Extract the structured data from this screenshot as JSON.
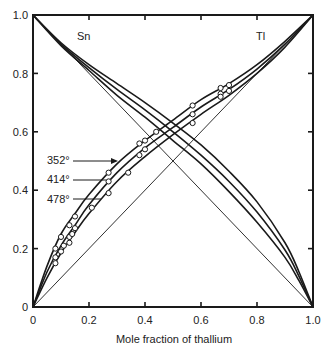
{
  "chart_data": {
    "type": "line",
    "title": "",
    "xlabel": "Mole fraction of thallium",
    "ylabel": "",
    "xlim": [
      0,
      1.0
    ],
    "ylim": [
      0,
      1.0
    ],
    "grid": false,
    "x_ticks": [
      "0",
      "0.2",
      "0.4",
      "0.6",
      "0.8",
      "1.0"
    ],
    "y_ticks": [
      "0",
      "0.2",
      "0.4",
      "0.6",
      "0.8",
      "1.0"
    ],
    "annotations": [
      {
        "text": "Sn",
        "x": 0.07,
        "y": 0.94
      },
      {
        "text": "Tl",
        "x": 0.9,
        "y": 0.94
      },
      {
        "text": "352°",
        "x": 0.04,
        "y": 0.49,
        "arrow_to": [
          0.28,
          0.48
        ]
      },
      {
        "text": "414°",
        "x": 0.04,
        "y": 0.43,
        "arrow_to": [
          0.26,
          0.43
        ]
      },
      {
        "text": "478°",
        "x": 0.04,
        "y": 0.37,
        "arrow_to": [
          0.24,
          0.37
        ]
      }
    ],
    "reference_lines": [
      {
        "name": "ideal-Tl",
        "points": [
          [
            0,
            0
          ],
          [
            1,
            1
          ]
        ]
      },
      {
        "name": "ideal-Sn",
        "points": [
          [
            0,
            1
          ],
          [
            1,
            0
          ]
        ]
      }
    ],
    "series": [
      {
        "name": "Tl 352°",
        "component": "Tl",
        "temperature": "352°",
        "curve": [
          [
            0,
            0
          ],
          [
            0.05,
            0.14
          ],
          [
            0.1,
            0.25
          ],
          [
            0.15,
            0.32
          ],
          [
            0.2,
            0.385
          ],
          [
            0.3,
            0.49
          ],
          [
            0.4,
            0.57
          ],
          [
            0.5,
            0.64
          ],
          [
            0.6,
            0.71
          ],
          [
            0.7,
            0.765
          ],
          [
            0.8,
            0.83
          ],
          [
            0.9,
            0.91
          ],
          [
            1,
            1
          ]
        ],
        "points": [
          [
            0.08,
            0.2
          ],
          [
            0.1,
            0.24
          ],
          [
            0.13,
            0.28
          ],
          [
            0.15,
            0.31
          ],
          [
            0.27,
            0.46
          ],
          [
            0.38,
            0.56
          ],
          [
            0.4,
            0.57
          ],
          [
            0.44,
            0.6
          ],
          [
            0.57,
            0.69
          ],
          [
            0.67,
            0.75
          ],
          [
            0.7,
            0.76
          ]
        ]
      },
      {
        "name": "Tl 414°",
        "component": "Tl",
        "temperature": "414°",
        "curve": [
          [
            0,
            0
          ],
          [
            0.05,
            0.12
          ],
          [
            0.1,
            0.21
          ],
          [
            0.15,
            0.28
          ],
          [
            0.2,
            0.35
          ],
          [
            0.3,
            0.46
          ],
          [
            0.4,
            0.545
          ],
          [
            0.5,
            0.615
          ],
          [
            0.6,
            0.685
          ],
          [
            0.7,
            0.745
          ],
          [
            0.8,
            0.815
          ],
          [
            0.9,
            0.9
          ],
          [
            1,
            1
          ]
        ],
        "points": [
          [
            0.08,
            0.17
          ],
          [
            0.11,
            0.21
          ],
          [
            0.13,
            0.24
          ],
          [
            0.15,
            0.27
          ],
          [
            0.27,
            0.43
          ],
          [
            0.38,
            0.52
          ],
          [
            0.4,
            0.54
          ],
          [
            0.57,
            0.66
          ],
          [
            0.67,
            0.73
          ],
          [
            0.7,
            0.74
          ]
        ]
      },
      {
        "name": "Tl 478°",
        "component": "Tl",
        "temperature": "478°",
        "curve": [
          [
            0,
            0
          ],
          [
            0.05,
            0.1
          ],
          [
            0.1,
            0.185
          ],
          [
            0.15,
            0.255
          ],
          [
            0.2,
            0.32
          ],
          [
            0.3,
            0.43
          ],
          [
            0.4,
            0.515
          ],
          [
            0.5,
            0.59
          ],
          [
            0.6,
            0.66
          ],
          [
            0.7,
            0.725
          ],
          [
            0.8,
            0.8
          ],
          [
            0.9,
            0.89
          ],
          [
            1,
            1
          ]
        ],
        "points": [
          [
            0.08,
            0.15
          ],
          [
            0.1,
            0.19
          ],
          [
            0.13,
            0.22
          ],
          [
            0.14,
            0.25
          ],
          [
            0.21,
            0.34
          ],
          [
            0.27,
            0.39
          ],
          [
            0.34,
            0.46
          ],
          [
            0.57,
            0.63
          ],
          [
            0.67,
            0.72
          ]
        ]
      },
      {
        "name": "Sn 352°",
        "component": "Sn",
        "temperature": "352°",
        "curve": [
          [
            0,
            1
          ],
          [
            0.1,
            0.905
          ],
          [
            0.2,
            0.83
          ],
          [
            0.3,
            0.765
          ],
          [
            0.4,
            0.7
          ],
          [
            0.5,
            0.63
          ],
          [
            0.6,
            0.555
          ],
          [
            0.7,
            0.465
          ],
          [
            0.8,
            0.36
          ],
          [
            0.9,
            0.22
          ],
          [
            0.95,
            0.12
          ],
          [
            1,
            0
          ]
        ]
      },
      {
        "name": "Sn 414°",
        "component": "Sn",
        "temperature": "414°",
        "curve": [
          [
            0,
            1
          ],
          [
            0.1,
            0.9
          ],
          [
            0.2,
            0.82
          ],
          [
            0.3,
            0.745
          ],
          [
            0.4,
            0.675
          ],
          [
            0.5,
            0.6
          ],
          [
            0.6,
            0.52
          ],
          [
            0.7,
            0.43
          ],
          [
            0.8,
            0.325
          ],
          [
            0.9,
            0.195
          ],
          [
            0.95,
            0.105
          ],
          [
            1,
            0
          ]
        ]
      },
      {
        "name": "Sn 478°",
        "component": "Sn",
        "temperature": "478°",
        "curve": [
          [
            0,
            1
          ],
          [
            0.1,
            0.895
          ],
          [
            0.2,
            0.81
          ],
          [
            0.3,
            0.725
          ],
          [
            0.4,
            0.65
          ],
          [
            0.5,
            0.57
          ],
          [
            0.6,
            0.49
          ],
          [
            0.7,
            0.395
          ],
          [
            0.8,
            0.29
          ],
          [
            0.9,
            0.17
          ],
          [
            0.95,
            0.09
          ],
          [
            1,
            0
          ]
        ]
      }
    ]
  },
  "labels": {
    "xlabel": "Mole fraction of thallium",
    "sn": "Sn",
    "tl": "Tl",
    "t352": "352°",
    "t414": "414°",
    "t478": "478°",
    "x_ticks": [
      "0",
      "0.2",
      "0.4",
      "0.6",
      "0.8",
      "1.0"
    ],
    "y_ticks": [
      "0",
      "0.2",
      "0.4",
      "0.6",
      "0.8",
      "1.0"
    ]
  }
}
